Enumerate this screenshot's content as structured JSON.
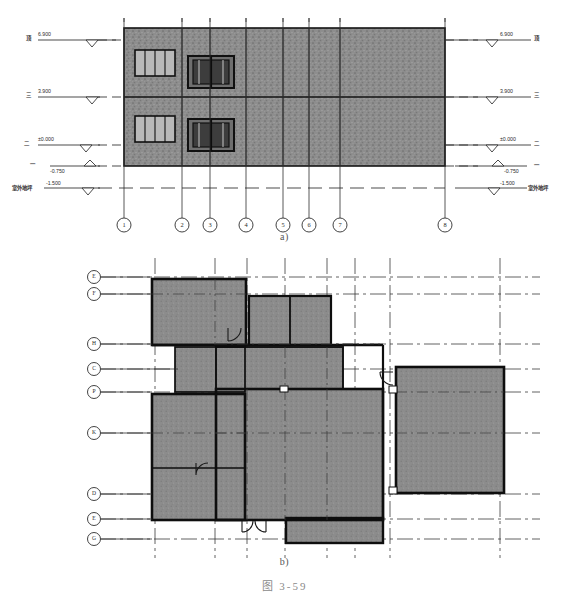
{
  "figure": {
    "caption_a": "a)",
    "caption_b": "b)",
    "figure_label": "图  3-59",
    "colors": {
      "wall_fill": "#8a8a8a",
      "plan_fill": "#8c8c8c",
      "line": "#1a1a1a",
      "grid": "#333333",
      "caption": "#7d7d7d"
    }
  },
  "elevation": {
    "title": "a)",
    "levels": [
      {
        "id": "L4",
        "name": "顶",
        "value": "6.900",
        "y": 40,
        "side": "both"
      },
      {
        "id": "L3",
        "name": "三",
        "value": "3.900",
        "y": 97,
        "side": "both"
      },
      {
        "id": "L2",
        "name": "二",
        "value": "±0.000",
        "y": 145,
        "side": "both"
      },
      {
        "id": "L1",
        "name": "一",
        "value": "-0.750",
        "y": 166,
        "side": "both"
      },
      {
        "id": "L0",
        "name": "室外地坪",
        "value": "-1.500",
        "y": 188,
        "side": "both"
      }
    ],
    "grid_axes": [
      {
        "label": "1",
        "x": 124
      },
      {
        "label": "2",
        "x": 182
      },
      {
        "label": "3",
        "x": 210
      },
      {
        "label": "4",
        "x": 246
      },
      {
        "label": "5",
        "x": 283
      },
      {
        "label": "6",
        "x": 309
      },
      {
        "label": "7",
        "x": 340
      },
      {
        "label": "8",
        "x": 445
      }
    ],
    "openings": [
      {
        "kind": "window",
        "panes": 3,
        "x": 135,
        "y": 50,
        "w": 40,
        "h": 26
      },
      {
        "kind": "door",
        "panes": 2,
        "x": 188,
        "y": 56,
        "w": 46,
        "h": 32
      },
      {
        "kind": "window",
        "panes": 3,
        "x": 135,
        "y": 116,
        "w": 40,
        "h": 26
      },
      {
        "kind": "door",
        "panes": 2,
        "x": 188,
        "y": 119,
        "w": 46,
        "h": 32
      }
    ],
    "body": {
      "x": 124,
      "y": 28,
      "w": 321,
      "h": 138
    },
    "floor_split_y": 97
  },
  "plan": {
    "title": "b)",
    "grid_letters": [
      {
        "label": "E",
        "y": 277
      },
      {
        "label": "F",
        "y": 294
      },
      {
        "label": "H",
        "y": 344
      },
      {
        "label": "C",
        "y": 369
      },
      {
        "label": "P",
        "y": 392
      },
      {
        "label": "K",
        "y": 433
      },
      {
        "label": "D",
        "y": 494
      },
      {
        "label": "E",
        "y": 519
      },
      {
        "label": "G",
        "y": 539
      }
    ],
    "vertical_grids": [
      155,
      215,
      247,
      285,
      327,
      355,
      390,
      500
    ],
    "rooms": [
      {
        "name": "room-upper-left",
        "x": 152,
        "y": 279,
        "w": 94,
        "h": 66
      },
      {
        "name": "room-upper-mid-a",
        "x": 249,
        "y": 296,
        "w": 40,
        "h": 49
      },
      {
        "name": "room-upper-mid-b",
        "x": 291,
        "y": 296,
        "w": 40,
        "h": 49
      },
      {
        "name": "room-left-strip",
        "x": 175,
        "y": 347,
        "w": 70,
        "h": 45
      },
      {
        "name": "room-center-core",
        "x": 216,
        "y": 347,
        "w": 127,
        "h": 40
      },
      {
        "name": "room-left-big",
        "x": 152,
        "y": 394,
        "w": 93,
        "h": 77
      },
      {
        "name": "room-left-lower",
        "x": 152,
        "y": 468,
        "w": 93,
        "h": 52
      },
      {
        "name": "room-center-main",
        "x": 216,
        "y": 389,
        "w": 167,
        "h": 131
      },
      {
        "name": "room-center-tail",
        "x": 286,
        "y": 518,
        "w": 97,
        "h": 25
      },
      {
        "name": "room-right-big",
        "x": 396,
        "y": 367,
        "w": 108,
        "h": 126
      }
    ],
    "doors": [
      {
        "name": "door-swing-upper",
        "x": 230,
        "y": 328,
        "r": 13
      },
      {
        "name": "door-swing-right",
        "x": 392,
        "y": 372,
        "r": 13
      },
      {
        "name": "door-swing-left",
        "x": 197,
        "y": 462,
        "r": 12
      },
      {
        "name": "door-swing-bottom-a",
        "x": 244,
        "y": 522,
        "r": 11
      },
      {
        "name": "door-swing-bottom-b",
        "x": 264,
        "y": 522,
        "r": 11
      }
    ]
  }
}
